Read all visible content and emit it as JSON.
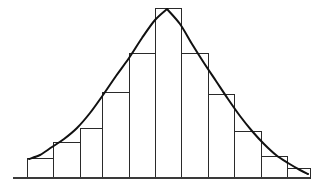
{
  "chart_data": {
    "type": "bar",
    "title": "",
    "subtitle": "",
    "xlabel": "",
    "ylabel": "",
    "grid": false,
    "legend": false,
    "legend_position": "none",
    "axis": {
      "x_range": [
        13,
        310
      ],
      "y_range": [
        0,
        170
      ],
      "x_ticks": [],
      "y_ticks": [],
      "x_tick_labels": [],
      "y_tick_labels": [],
      "baseline_y_px": 178,
      "baseline_x_start_px": 13,
      "baseline_x_end_px": 310
    },
    "categories": [
      "1",
      "2",
      "3",
      "4",
      "5",
      "6",
      "7",
      "8",
      "9",
      "10",
      "11"
    ],
    "values": [
      20,
      36,
      50,
      86,
      125,
      170,
      125,
      84,
      47,
      22,
      10
    ],
    "bar_left_px": [
      27,
      53,
      80,
      102,
      129,
      155,
      181,
      208,
      234,
      261,
      287
    ],
    "bar_right_px": [
      53,
      80,
      102,
      129,
      155,
      181,
      208,
      234,
      261,
      287,
      310
    ],
    "bar_top_px": [
      158,
      142,
      128,
      92,
      53,
      8,
      53,
      94,
      131,
      156,
      168
    ],
    "series": [
      {
        "name": "frequency",
        "type": "bar",
        "values": [
          20,
          36,
          50,
          86,
          125,
          170,
          125,
          84,
          47,
          22,
          10
        ]
      },
      {
        "name": "fitted-curve",
        "type": "line",
        "points_px": [
          [
            29,
            159
          ],
          [
            40,
            155
          ],
          [
            52,
            147
          ],
          [
            64,
            139
          ],
          [
            77,
            128
          ],
          [
            90,
            113
          ],
          [
            103,
            95
          ],
          [
            116,
            76
          ],
          [
            129,
            58
          ],
          [
            142,
            38
          ],
          [
            155,
            20
          ],
          [
            167,
            9
          ],
          [
            180,
            24
          ],
          [
            192,
            44
          ],
          [
            204,
            63
          ],
          [
            216,
            81
          ],
          [
            228,
            99
          ],
          [
            240,
            116
          ],
          [
            252,
            131
          ],
          [
            264,
            144
          ],
          [
            276,
            155
          ],
          [
            288,
            163
          ],
          [
            300,
            170
          ],
          [
            308,
            174
          ]
        ]
      }
    ],
    "annotations": [],
    "colors": {
      "bar_fill": "#ffffff",
      "bar_stroke": "#2a2a2a",
      "curve_stroke": "#111111",
      "baseline_stroke": "#3a3a3a",
      "background": "#ffffff"
    }
  },
  "figure": {
    "caption": "",
    "width_px": 322,
    "height_px": 191
  }
}
